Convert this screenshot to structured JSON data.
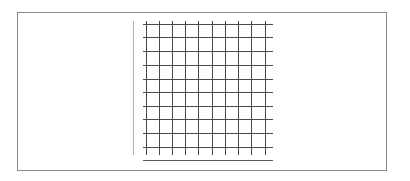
{
  "chart_data": {
    "type": "table",
    "title": "",
    "xlabel": "",
    "ylabel": "",
    "grid": true,
    "legend": null,
    "series": [],
    "columns": 10,
    "rows": 10
  },
  "layout": {
    "frame": {
      "x": 17,
      "y": 12,
      "w": 370,
      "h": 159,
      "color": "#8a8a8a"
    },
    "y_axis": {
      "x": 133,
      "y1": 21,
      "y2": 155,
      "color": "#b0b0b0"
    },
    "grid": {
      "v_lines_x": [
        146,
        159,
        172,
        185,
        198,
        212,
        225,
        238,
        251,
        265
      ],
      "v_y1": 21,
      "v_y2": 155,
      "h_lines_y": [
        24,
        37,
        51,
        65,
        79,
        92,
        106,
        119,
        133,
        147
      ],
      "h_x1": 143,
      "h_x2": 273,
      "color": "#4a4a4a"
    },
    "x_axis": {
      "y": 160,
      "x1": 143,
      "x2": 273,
      "color": "#5a5a5a"
    }
  }
}
